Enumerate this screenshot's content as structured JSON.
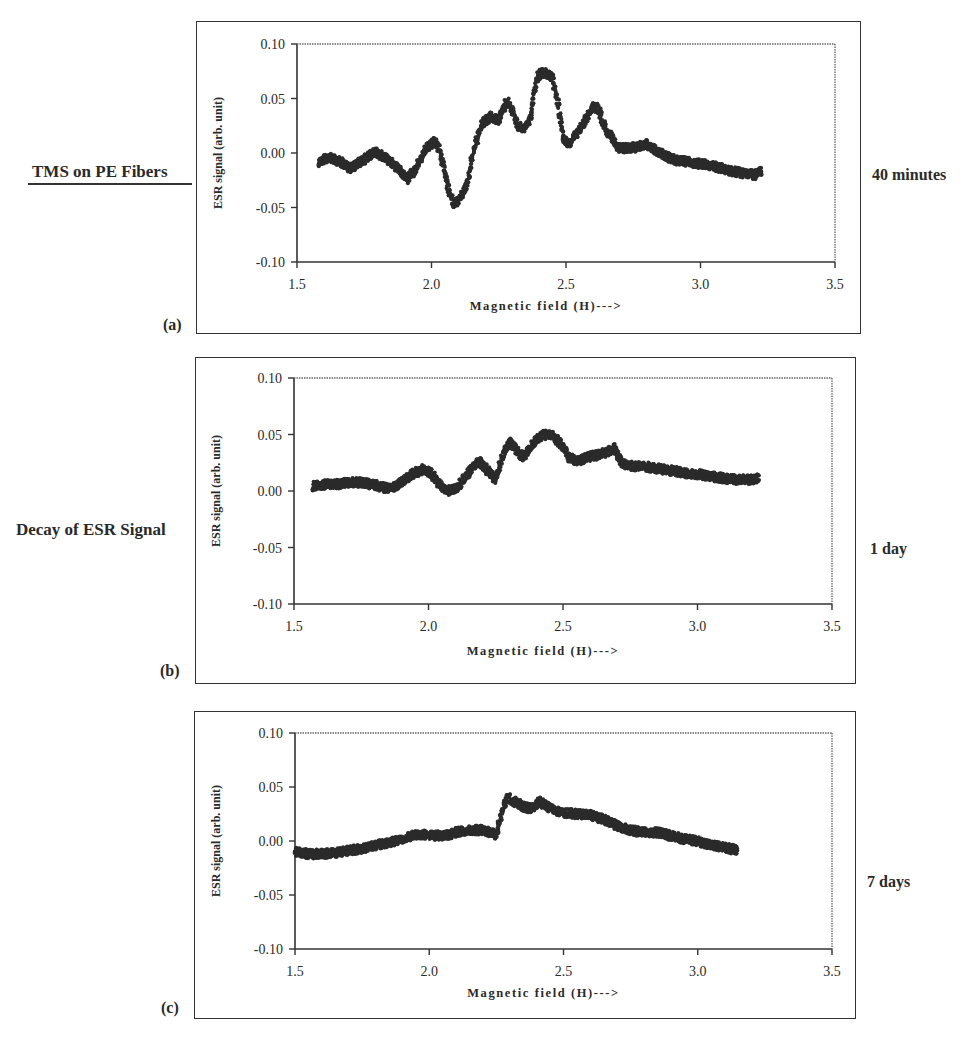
{
  "figure": {
    "left_labels": {
      "title": "TMS on PE Fibers",
      "subtitle": "Decay of ESR Signal"
    },
    "panels": [
      {
        "tag": "(a)",
        "time_label": "40 minutes"
      },
      {
        "tag": "(b)",
        "time_label": "1 day"
      },
      {
        "tag": "(c)",
        "time_label": "7 days"
      }
    ],
    "colors": {
      "points": "#2b2b2b",
      "axis": "#333333",
      "frame": "#333333"
    }
  },
  "chart_data": [
    {
      "type": "scatter",
      "panel": "(a)",
      "annotation": "40 minutes",
      "title": "",
      "xlabel": "Magnetic field (H)--->",
      "ylabel": "ESR signal (arb. unit)",
      "xlim": [
        1.5,
        3.5
      ],
      "ylim": [
        -0.1,
        0.1
      ],
      "xticks": [
        "1.5",
        "2.0",
        "2.5",
        "3.0",
        "3.5"
      ],
      "yticks": [
        "0.10",
        "0.05",
        "0.00",
        "-0.05",
        "-0.10"
      ],
      "grid": false,
      "x": [
        1.58,
        1.62,
        1.66,
        1.7,
        1.75,
        1.79,
        1.83,
        1.87,
        1.91,
        1.94,
        1.98,
        2.01,
        2.03,
        2.06,
        2.08,
        2.1,
        2.13,
        2.16,
        2.19,
        2.22,
        2.25,
        2.28,
        2.3,
        2.32,
        2.35,
        2.37,
        2.39,
        2.41,
        2.43,
        2.45,
        2.47,
        2.49,
        2.51,
        2.54,
        2.57,
        2.6,
        2.62,
        2.65,
        2.7,
        2.75,
        2.8,
        2.85,
        2.9,
        2.95,
        3.0,
        3.05,
        3.1,
        3.15,
        3.2,
        3.23
      ],
      "y": [
        -0.008,
        -0.004,
        -0.008,
        -0.014,
        -0.006,
        0.001,
        -0.005,
        -0.013,
        -0.024,
        -0.015,
        0.004,
        0.011,
        0.003,
        -0.03,
        -0.046,
        -0.044,
        -0.03,
        0.005,
        0.028,
        0.033,
        0.03,
        0.048,
        0.04,
        0.025,
        0.022,
        0.035,
        0.068,
        0.074,
        0.073,
        0.068,
        0.045,
        0.015,
        0.008,
        0.018,
        0.03,
        0.043,
        0.04,
        0.02,
        0.004,
        0.005,
        0.008,
        0.0,
        -0.006,
        -0.008,
        -0.01,
        -0.012,
        -0.016,
        -0.018,
        -0.02,
        -0.017
      ]
    },
    {
      "type": "scatter",
      "panel": "(b)",
      "annotation": "1 day",
      "title": "",
      "xlabel": "Magnetic field (H)--->",
      "ylabel": "ESR signal (arb. unit)",
      "xlim": [
        1.5,
        3.5
      ],
      "ylim": [
        -0.1,
        0.1
      ],
      "xticks": [
        "1.5",
        "2.0",
        "2.5",
        "3.0",
        "3.5"
      ],
      "yticks": [
        "0.10",
        "0.05",
        "0.00",
        "-0.05",
        "-0.10"
      ],
      "grid": false,
      "x": [
        1.57,
        1.62,
        1.67,
        1.72,
        1.77,
        1.82,
        1.86,
        1.9,
        1.94,
        1.98,
        2.01,
        2.04,
        2.07,
        2.1,
        2.13,
        2.16,
        2.19,
        2.22,
        2.25,
        2.27,
        2.3,
        2.32,
        2.35,
        2.37,
        2.4,
        2.43,
        2.46,
        2.49,
        2.52,
        2.55,
        2.59,
        2.63,
        2.66,
        2.69,
        2.72,
        2.76,
        2.8,
        2.85,
        2.9,
        2.95,
        3.0,
        3.05,
        3.1,
        3.15,
        3.2,
        3.23
      ],
      "y": [
        0.004,
        0.006,
        0.006,
        0.008,
        0.007,
        0.004,
        0.002,
        0.008,
        0.015,
        0.019,
        0.016,
        0.006,
        0.0,
        0.002,
        0.01,
        0.02,
        0.026,
        0.018,
        0.01,
        0.028,
        0.044,
        0.038,
        0.03,
        0.036,
        0.045,
        0.05,
        0.049,
        0.042,
        0.03,
        0.026,
        0.03,
        0.032,
        0.034,
        0.038,
        0.024,
        0.022,
        0.022,
        0.02,
        0.018,
        0.016,
        0.015,
        0.013,
        0.011,
        0.01,
        0.01,
        0.012
      ]
    },
    {
      "type": "scatter",
      "panel": "(c)",
      "annotation": "7 days",
      "title": "",
      "xlabel": "Magnetic field (H)--->",
      "ylabel": "ESR signal (arb. unit)",
      "xlim": [
        1.5,
        3.5
      ],
      "ylim": [
        -0.1,
        0.1
      ],
      "xticks": [
        "1.5",
        "2.0",
        "2.5",
        "3.0",
        "3.5"
      ],
      "yticks": [
        "0.10",
        "0.05",
        "0.00",
        "-0.05",
        "-0.10"
      ],
      "grid": false,
      "x": [
        1.5,
        1.55,
        1.6,
        1.65,
        1.7,
        1.75,
        1.8,
        1.85,
        1.9,
        1.95,
        2.0,
        2.05,
        2.1,
        2.15,
        2.2,
        2.25,
        2.27,
        2.29,
        2.32,
        2.35,
        2.38,
        2.41,
        2.44,
        2.47,
        2.5,
        2.55,
        2.6,
        2.65,
        2.7,
        2.75,
        2.8,
        2.85,
        2.9,
        2.95,
        3.0,
        3.05,
        3.1,
        3.15
      ],
      "y": [
        -0.01,
        -0.012,
        -0.012,
        -0.011,
        -0.009,
        -0.007,
        -0.004,
        -0.002,
        0.002,
        0.006,
        0.006,
        0.004,
        0.008,
        0.01,
        0.01,
        0.006,
        0.025,
        0.04,
        0.036,
        0.032,
        0.03,
        0.036,
        0.032,
        0.028,
        0.026,
        0.025,
        0.024,
        0.02,
        0.014,
        0.01,
        0.008,
        0.008,
        0.005,
        0.002,
        0.0,
        -0.004,
        -0.006,
        -0.009
      ]
    }
  ]
}
